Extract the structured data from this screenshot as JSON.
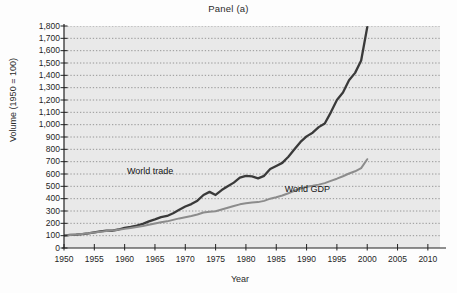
{
  "figure": {
    "title": "Panel (a)",
    "xlabel": "Year",
    "ylabel": "Volume (1950 = 100)"
  },
  "labels": {
    "world_trade": "World trade",
    "world_gdp": "World GDP"
  },
  "colors": {
    "trade_line": "#3a3a3a",
    "gdp_line": "#8c8c8c",
    "plot_background": "#e9e9e9",
    "gridline": "#707070",
    "axis": "#222222"
  },
  "chart_data": {
    "type": "line",
    "title": "Panel (a)",
    "xlabel": "Year",
    "ylabel": "Volume (1950 = 100)",
    "xlim": [
      1950,
      2012
    ],
    "ylim": [
      0,
      1800
    ],
    "ytick_labels": [
      "0",
      "100",
      "200",
      "300",
      "400",
      "500",
      "600",
      "700",
      "800",
      "900",
      "1,000",
      "1,100",
      "1,200",
      "1,300",
      "1,400",
      "1,500",
      "1,600",
      "1,700",
      "1,800"
    ],
    "ytick_values": [
      0,
      100,
      200,
      300,
      400,
      500,
      600,
      700,
      800,
      900,
      1000,
      1100,
      1200,
      1300,
      1400,
      1500,
      1600,
      1700,
      1800
    ],
    "xtick_labels": [
      "1950",
      "1955",
      "1960",
      "1965",
      "1970",
      "1975",
      "1980",
      "1985",
      "1990",
      "1995",
      "2000",
      "2005",
      "2010"
    ],
    "xtick_values": [
      1950,
      1955,
      1960,
      1965,
      1970,
      1975,
      1980,
      1985,
      1990,
      1995,
      2000,
      2005,
      2010
    ],
    "grid": "horizontal-dotted",
    "legend": "inline-annotations",
    "series": [
      {
        "name": "World trade",
        "color": "#3a3a3a",
        "x": [
          1950,
          1951,
          1952,
          1953,
          1954,
          1955,
          1956,
          1957,
          1958,
          1959,
          1960,
          1961,
          1962,
          1963,
          1964,
          1965,
          1966,
          1967,
          1968,
          1969,
          1970,
          1971,
          1972,
          1973,
          1974,
          1975,
          1976,
          1977,
          1978,
          1979,
          1980,
          1981,
          1982,
          1983,
          1984,
          1985,
          1986,
          1987,
          1988,
          1989,
          1990,
          1991,
          1992,
          1993,
          1994,
          1995,
          1996,
          1997,
          1998,
          1999,
          2000
        ],
        "values": [
          100,
          106,
          108,
          112,
          118,
          126,
          134,
          140,
          140,
          150,
          164,
          172,
          182,
          196,
          216,
          232,
          250,
          260,
          282,
          310,
          336,
          356,
          384,
          430,
          455,
          430,
          470,
          500,
          530,
          570,
          585,
          580,
          565,
          585,
          640,
          665,
          690,
          740,
          800,
          860,
          905,
          935,
          980,
          1010,
          1100,
          1200,
          1260,
          1360,
          1420,
          1520,
          1790
        ]
      },
      {
        "name": "World GDP",
        "color": "#8c8c8c",
        "x": [
          1950,
          1951,
          1952,
          1953,
          1954,
          1955,
          1956,
          1957,
          1958,
          1959,
          1960,
          1961,
          1962,
          1963,
          1964,
          1965,
          1966,
          1967,
          1968,
          1969,
          1970,
          1971,
          1972,
          1973,
          1974,
          1975,
          1976,
          1977,
          1978,
          1979,
          1980,
          1981,
          1982,
          1983,
          1984,
          1985,
          1986,
          1987,
          1988,
          1989,
          1990,
          1991,
          1992,
          1993,
          1994,
          1995,
          1996,
          1997,
          1998,
          1999,
          2000
        ],
        "values": [
          100,
          105,
          109,
          114,
          119,
          126,
          132,
          137,
          141,
          148,
          155,
          162,
          170,
          178,
          188,
          198,
          208,
          216,
          228,
          240,
          250,
          260,
          272,
          288,
          294,
          298,
          312,
          326,
          340,
          354,
          362,
          368,
          372,
          382,
          400,
          412,
          426,
          444,
          464,
          482,
          496,
          504,
          514,
          526,
          544,
          562,
          582,
          604,
          622,
          648,
          720
        ]
      }
    ],
    "annotations": [
      {
        "text": "World trade",
        "x": 1965,
        "y": 620
      },
      {
        "text": "World GDP",
        "x": 1991,
        "y": 470
      }
    ]
  }
}
